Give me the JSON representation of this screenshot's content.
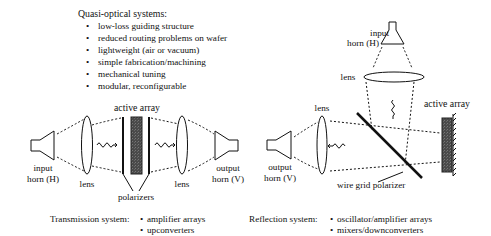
{
  "features": {
    "title": "Quasi-optical systems:",
    "bullet": "•",
    "items": [
      "low-loss guiding structure",
      "reduced routing problems on wafer",
      "lightweight (air or vacuum)",
      "simple fabrication/machining",
      "mechanical tuning",
      "modular, reconfigurable"
    ]
  },
  "transmission": {
    "input_horn": [
      "input",
      "horn (H)"
    ],
    "lens_left": "lens",
    "active_array": "active array",
    "polarizers": "polarizers",
    "lens_right": "lens",
    "output_horn": [
      "output",
      "horn (V)"
    ],
    "caption_label": "Transmission system:",
    "applications": [
      "amplifier arrays",
      "upconverters"
    ]
  },
  "reflection": {
    "input_horn": [
      "input",
      "horn (H)"
    ],
    "lens_top": "lens",
    "lens_left": "lens",
    "active_array": "active array",
    "output_horn": [
      "output",
      "horn (V)"
    ],
    "polarizer": "wire grid polarizer",
    "caption_label": "Reflection system:",
    "applications": [
      "oscillator/amplifier arrays",
      "mixers/downconverters"
    ]
  },
  "colors": {
    "line": "#111111",
    "array_fill": "#555555"
  }
}
